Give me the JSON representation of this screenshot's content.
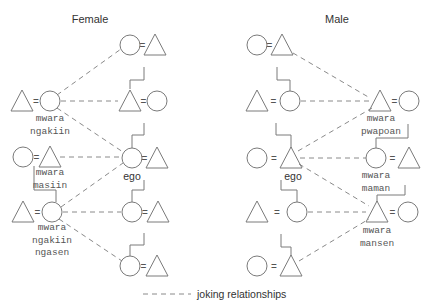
{
  "panels": {
    "female": {
      "title": "Female",
      "title_pos": [
        90,
        23
      ],
      "couples": [
        {
          "id": "f-r1",
          "left": "circle",
          "right": "triangle",
          "cx": [
            130,
            155
          ],
          "cy": 45
        },
        {
          "id": "f-r2a",
          "left": "triangle",
          "right": "circle",
          "cx": [
            22,
            50
          ],
          "cy": 101
        },
        {
          "id": "f-r2b",
          "left": "triangle",
          "right": "circle",
          "cx": [
            130,
            157
          ],
          "cy": 101
        },
        {
          "id": "f-r3a",
          "left": "circle",
          "right": "triangle",
          "cx": [
            23,
            50
          ],
          "cy": 157
        },
        {
          "id": "f-ego",
          "left": "circle",
          "right": "triangle",
          "cx": [
            132,
            157
          ],
          "cy": 158
        },
        {
          "id": "f-r4a",
          "left": "triangle",
          "right": "circle",
          "cx": [
            23,
            52
          ],
          "cy": 212
        },
        {
          "id": "f-r4b",
          "left": "circle",
          "right": "triangle",
          "cx": [
            132,
            158
          ],
          "cy": 212
        },
        {
          "id": "f-r5",
          "left": "circle",
          "right": "triangle",
          "cx": [
            130,
            157
          ],
          "cy": 266
        }
      ],
      "descent_lines": [
        "M144 67 L144 80 L130 80 L130 89",
        "M144 123 L144 135 L132 135 L132 148",
        "M144 180 L144 190 L132 190 L132 202",
        "M144 233 L144 245 L130 245 L130 256",
        "M34 166 L34 190 L56 190 L56 202"
      ],
      "joking_lines": [
        [
          57,
          95,
          121,
          49
        ],
        [
          61,
          101,
          118,
          101
        ],
        [
          57,
          108,
          123,
          152
        ],
        [
          60,
          157,
          122,
          157
        ],
        [
          61,
          207,
          123,
          163
        ],
        [
          63,
          212,
          121,
          212
        ],
        [
          59,
          219,
          122,
          261
        ]
      ],
      "terms": [
        {
          "lines": [
            "mwara",
            "ngakiin"
          ],
          "x": 50,
          "y": 121
        },
        {
          "lines": [
            "mwara",
            "masiin"
          ],
          "x": 50,
          "y": 175
        },
        {
          "lines": [
            "mwara",
            "ngakiin",
            "ngasen"
          ],
          "x": 52,
          "y": 230
        }
      ],
      "ego_label": {
        "text": "ego",
        "x": 132,
        "y": 180
      }
    },
    "male": {
      "title": "Male",
      "title_pos": [
        337,
        23
      ],
      "couples": [
        {
          "id": "m-r1",
          "left": "circle",
          "right": "triangle",
          "cx": [
            257,
            282
          ],
          "cy": 45
        },
        {
          "id": "m-r2a",
          "left": "triangle",
          "right": "circle",
          "cx": [
            257,
            290
          ],
          "cy": 101
        },
        {
          "id": "m-r2b",
          "left": "triangle",
          "right": "circle",
          "cx": [
            380,
            409
          ],
          "cy": 101
        },
        {
          "id": "m-ego",
          "left": "circle",
          "right": "triangle",
          "cx": [
            257,
            291
          ],
          "cy": 158
        },
        {
          "id": "m-r3b",
          "left": "circle",
          "right": "triangle",
          "cx": [
            376,
            409
          ],
          "cy": 158
        },
        {
          "id": "m-r4a",
          "left": "triangle",
          "right": "circle",
          "cx": [
            257,
            297
          ],
          "cy": 212
        },
        {
          "id": "m-r4b",
          "left": "triangle",
          "right": "circle",
          "cx": [
            377,
            408
          ],
          "cy": 212
        },
        {
          "id": "m-r5",
          "left": "circle",
          "right": "triangle",
          "cx": [
            257,
            291
          ],
          "cy": 266
        }
      ],
      "descent_lines": [
        "M277 67 L277 80 L290 80 L290 91",
        "M276 123 L276 135 L291 135 L291 148",
        "M281 180 L281 190 L297 190 L297 202",
        "M281 234 L281 247 L291 247 L291 256",
        "M408 124 L408 138 L376 138 L376 148",
        "M405 185 L405 195 L377 195 L377 202"
      ],
      "joking_lines": [
        [
          293,
          53,
          370,
          98
        ],
        [
          301,
          101,
          369,
          101
        ],
        [
          298,
          151,
          372,
          108
        ],
        [
          300,
          158,
          366,
          158
        ],
        [
          299,
          164,
          369,
          206
        ],
        [
          308,
          212,
          366,
          212
        ],
        [
          299,
          261,
          369,
          219
        ]
      ],
      "terms": [
        {
          "lines": [
            "mwara",
            "pwapoan"
          ],
          "x": 381,
          "y": 121
        },
        {
          "lines": [
            "mwara",
            "maman"
          ],
          "x": 376,
          "y": 178
        },
        {
          "lines": [
            "mwara",
            "mansen"
          ],
          "x": 377,
          "y": 233
        }
      ],
      "ego_label": {
        "text": "ego",
        "x": 293,
        "y": 180
      }
    }
  },
  "legend": {
    "line": [
      143,
      294,
      191,
      294
    ],
    "label": "joking relationships",
    "label_pos": [
      197,
      298
    ]
  },
  "colors": {
    "stroke": "#7a7a7a",
    "text": "#333333"
  }
}
